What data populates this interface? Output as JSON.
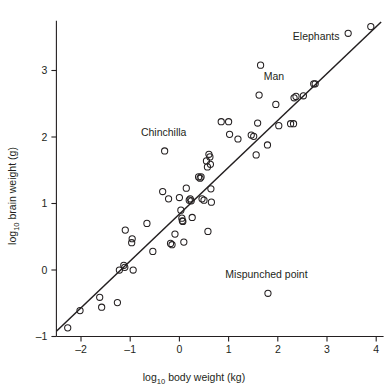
{
  "chart_data": {
    "type": "scatter",
    "title": "",
    "xlabel": "log10 body weight (kg)",
    "ylabel": "log10 brain weight (g)",
    "xlabel_base": "log",
    "xlabel_sub": "10",
    "xlabel_rest": " body weight (kg)",
    "ylabel_base": "log",
    "ylabel_sub": "10",
    "ylabel_rest": " brain weight (g)",
    "xlim": [
      -2.5,
      4.1
    ],
    "ylim": [
      -1.0,
      3.75
    ],
    "xticks": [
      -2,
      -1,
      0,
      1,
      2,
      3,
      4
    ],
    "xtick_labels": [
      "-2",
      "-1",
      "0",
      "1",
      "2",
      "3",
      "4"
    ],
    "yticks": [
      -1,
      0,
      1,
      2,
      3
    ],
    "ytick_labels": [
      "-1",
      "0",
      "1",
      "2",
      "3"
    ],
    "grid": false,
    "legend": "none",
    "marker": "open-circle",
    "marker_color": "#231f20",
    "line_color": "#231f20",
    "fit_line": {
      "type": "regression",
      "x_start": -2.5,
      "y_start": -0.92,
      "x_end": 4.1,
      "y_end": 3.73,
      "slope": 0.705,
      "intercept": 0.84
    },
    "annotations": [
      {
        "text": "Elephants",
        "x": 2.78,
        "y": 3.46
      },
      {
        "text": "Man",
        "x": 1.92,
        "y": 2.86
      },
      {
        "text": "Chinchilla",
        "x": -0.32,
        "y": 2.02
      },
      {
        "text": "Mispunched point",
        "x": 1.77,
        "y": -0.12
      }
    ],
    "points": [
      {
        "x": -2.27,
        "y": -0.87
      },
      {
        "x": -2.02,
        "y": -0.61
      },
      {
        "x": -1.62,
        "y": -0.41
      },
      {
        "x": -1.58,
        "y": -0.56
      },
      {
        "x": -1.26,
        "y": -0.49
      },
      {
        "x": -1.22,
        "y": 0.0
      },
      {
        "x": -1.13,
        "y": 0.07
      },
      {
        "x": -1.11,
        "y": 0.04
      },
      {
        "x": -1.1,
        "y": 0.6
      },
      {
        "x": -0.96,
        "y": 0.47
      },
      {
        "x": -0.97,
        "y": 0.41
      },
      {
        "x": -0.94,
        "y": 0.0
      },
      {
        "x": -0.66,
        "y": 0.7
      },
      {
        "x": -0.54,
        "y": 0.28
      },
      {
        "x": -0.34,
        "y": 1.18
      },
      {
        "x": -0.3,
        "y": 1.79
      },
      {
        "x": -0.22,
        "y": 1.07
      },
      {
        "x": -0.18,
        "y": 0.4
      },
      {
        "x": -0.15,
        "y": 0.38
      },
      {
        "x": -0.09,
        "y": 0.54
      },
      {
        "x": 0.0,
        "y": 1.09
      },
      {
        "x": 0.03,
        "y": 0.9
      },
      {
        "x": 0.05,
        "y": 0.78
      },
      {
        "x": 0.06,
        "y": 0.74
      },
      {
        "x": 0.07,
        "y": 0.73
      },
      {
        "x": 0.09,
        "y": 0.42
      },
      {
        "x": 0.14,
        "y": 1.23
      },
      {
        "x": 0.2,
        "y": 1.05
      },
      {
        "x": 0.22,
        "y": 1.07
      },
      {
        "x": 0.24,
        "y": 1.04
      },
      {
        "x": 0.26,
        "y": 0.79
      },
      {
        "x": 0.39,
        "y": 1.4
      },
      {
        "x": 0.42,
        "y": 1.38
      },
      {
        "x": 0.44,
        "y": 1.4
      },
      {
        "x": 0.46,
        "y": 1.07
      },
      {
        "x": 0.5,
        "y": 1.05
      },
      {
        "x": 0.55,
        "y": 1.64
      },
      {
        "x": 0.57,
        "y": 1.55
      },
      {
        "x": 0.58,
        "y": 0.58
      },
      {
        "x": 0.6,
        "y": 1.74
      },
      {
        "x": 0.62,
        "y": 1.7
      },
      {
        "x": 0.63,
        "y": 1.59
      },
      {
        "x": 0.64,
        "y": 1.22
      },
      {
        "x": 0.65,
        "y": 1.02
      },
      {
        "x": 0.85,
        "y": 2.23
      },
      {
        "x": 1.0,
        "y": 2.23
      },
      {
        "x": 1.02,
        "y": 2.04
      },
      {
        "x": 1.19,
        "y": 1.97
      },
      {
        "x": 1.46,
        "y": 2.03
      },
      {
        "x": 1.51,
        "y": 2.01
      },
      {
        "x": 1.56,
        "y": 1.73
      },
      {
        "x": 1.59,
        "y": 2.21
      },
      {
        "x": 1.62,
        "y": 2.63
      },
      {
        "x": 1.65,
        "y": 3.08
      },
      {
        "x": 1.79,
        "y": 1.88
      },
      {
        "x": 1.8,
        "y": -0.35
      },
      {
        "x": 1.96,
        "y": 2.49
      },
      {
        "x": 2.02,
        "y": 2.17
      },
      {
        "x": 2.26,
        "y": 2.2
      },
      {
        "x": 2.32,
        "y": 2.2
      },
      {
        "x": 2.33,
        "y": 2.59
      },
      {
        "x": 2.37,
        "y": 2.61
      },
      {
        "x": 2.52,
        "y": 2.62
      },
      {
        "x": 2.73,
        "y": 2.8
      },
      {
        "x": 2.76,
        "y": 2.8
      },
      {
        "x": 3.43,
        "y": 3.56
      },
      {
        "x": 3.89,
        "y": 3.66
      }
    ]
  },
  "figure": {
    "background": "#ffffff",
    "ink": "#231f20"
  }
}
